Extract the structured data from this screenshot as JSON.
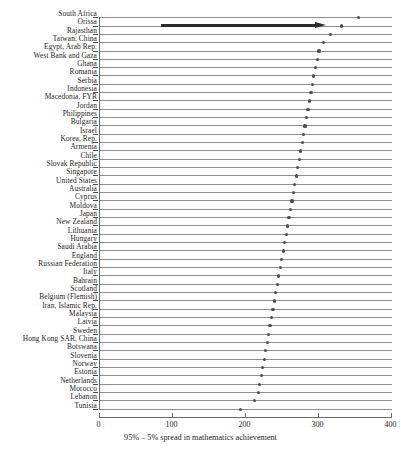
{
  "chart_data": {
    "type": "scatter",
    "title": "",
    "subtitle": "",
    "xlabel": "95% – 5% spread in mathematics achievement",
    "ylabel": "",
    "xlim": [
      0,
      400
    ],
    "xticks": [
      0,
      100,
      200,
      300,
      400
    ],
    "xtick_labels": [
      "0",
      "100",
      "200",
      "300",
      "400"
    ],
    "grid": false,
    "orientation": "horizontal",
    "legend": null,
    "categories": [
      "South Africa",
      "Orissa",
      "Rajasthan",
      "Taiwan, China",
      "Egypt, Arab Rep.",
      "West Bank and Gaza",
      "Ghana",
      "Romania",
      "Serbia",
      "Indonesia",
      "Macedonia, FYR",
      "Jordan",
      "Philippines",
      "Bulgaria",
      "Israel",
      "Korea, Rep.",
      "Armenia",
      "Chile",
      "Slovak Republic",
      "Singapore",
      "United States",
      "Australia",
      "Cyprus",
      "Moldova",
      "Japan",
      "New Zealand",
      "Lithuania",
      "Hungary",
      "Saudi Arabia",
      "England",
      "Russian Federation",
      "Italy",
      "Bahrain",
      "Scotland",
      "Belgium (Flemish)",
      "Iran, Islamic Rep.",
      "Malaysia",
      "Latvia",
      "Sweden",
      "Hong Kong SAR, China",
      "Botswana",
      "Slovenia",
      "Norway",
      "Estonia",
      "Netherlands",
      "Morocco",
      "Lebanon",
      "Tunisia"
    ],
    "values": [
      356,
      333,
      318,
      308,
      302,
      300,
      297,
      295,
      293,
      291,
      289,
      287,
      285,
      283,
      281,
      279,
      277,
      275,
      273,
      271,
      269,
      267,
      265,
      263,
      261,
      259,
      257,
      255,
      253,
      251,
      249,
      247,
      245,
      243,
      241,
      239,
      237,
      235,
      233,
      231,
      229,
      227,
      225,
      223,
      221,
      219,
      214,
      195
    ],
    "annotations": [
      {
        "type": "arrow",
        "name": "rajasthan-orissa-highlight-arrow",
        "direction": "right",
        "x_start": 86,
        "x_end": 312,
        "row_index": 1,
        "color": "#2b2b2b"
      }
    ]
  },
  "axis": {
    "caption": "95% – 5% spread in mathematics achievement",
    "tick_0": "0",
    "tick_100": "100",
    "tick_200": "200",
    "tick_300": "300",
    "tick_400": "400"
  },
  "colors": {
    "dot": "#4c4c56",
    "line": "#8e8e8e",
    "axis": "#6a6a6a",
    "arrow": "#2b2b2b",
    "text": "#1c1c1c",
    "background": "#ffffff"
  }
}
